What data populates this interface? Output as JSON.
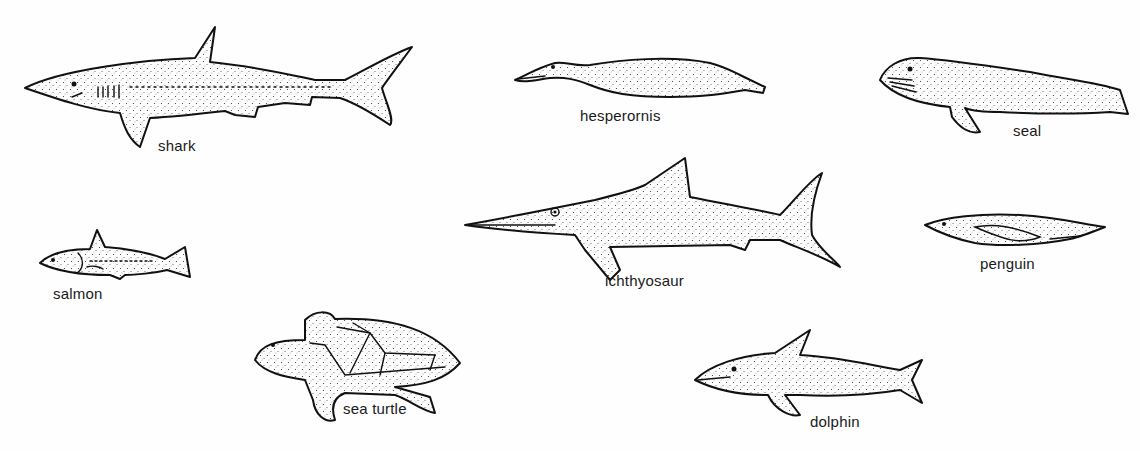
{
  "figure": {
    "background_color": "#fefefe",
    "ink_color": "#111111"
  },
  "animals": [
    {
      "id": "shark",
      "label": "shark"
    },
    {
      "id": "hesperornis",
      "label": "hesperornis"
    },
    {
      "id": "seal",
      "label": "seal"
    },
    {
      "id": "ichthyosaur",
      "label": "ichthyosaur"
    },
    {
      "id": "penguin",
      "label": "penguin"
    },
    {
      "id": "salmon",
      "label": "salmon"
    },
    {
      "id": "sea-turtle",
      "label": "sea turtle"
    },
    {
      "id": "dolphin",
      "label": "dolphin"
    }
  ]
}
